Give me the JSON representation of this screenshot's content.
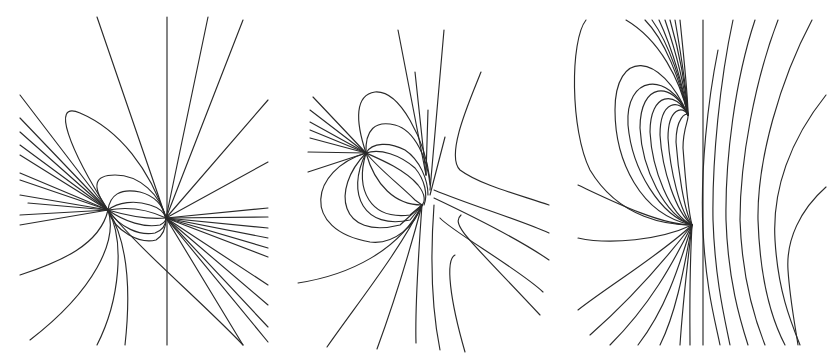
{
  "figure": {
    "background": "#ffffff",
    "stroke_color": "#2a2a2a",
    "panels": [
      {
        "id": "panel-1",
        "description": "Field lines of two like/unlike point sources, left pair with vertical symmetry line",
        "sources": [
          [
            108,
            210
          ],
          [
            166,
            218
          ]
        ],
        "paths": [
          "M167,17 L167,345",
          "M97,17 L166,218",
          "M208,17 L166,218",
          "M243,20 L166,218",
          "M268,100 L166,218",
          "M268,162 L166,218",
          "M268,208 L166,218",
          "M268,217 L166,218",
          "M268,228 L166,218",
          "M268,238 L166,218",
          "M268,248 L166,218",
          "M268,257 L166,218",
          "M268,285 L166,218",
          "M268,305 L166,218",
          "M268,327 L166,218",
          "M268,342 L166,218",
          "M243,345 L166,218",
          "M20,95 L108,210",
          "M20,118 L108,210",
          "M20,132 L108,210",
          "M20,145 L108,210",
          "M20,155 L108,210",
          "M20,173 L108,210",
          "M20,180 L108,210",
          "M20,195 L108,210",
          "M28,203 L108,210",
          "M20,215 L108,210",
          "M20,225 L108,210",
          "M108,210 C70,150 50,100 80,113 C120,130 150,170 166,218",
          "M108,210 C90,185 95,175 115,175 C140,175 160,195 166,218",
          "M108,210 C110,195 120,188 140,192 C155,196 163,205 166,218",
          "M108,210 C118,202 135,200 150,205 C160,208 164,212 166,218",
          "M108,210 C125,207 145,208 166,218",
          "M108,210 C125,215 145,220 166,218",
          "M108,210 C125,222 145,228 160,225 C164,223 166,220 166,218",
          "M108,210 C120,228 140,236 155,233 C163,230 166,224 166,218",
          "M108,210 C115,232 140,244 156,240 C164,235 166,226 166,218",
          "M108,210 C100,245 60,262 20,275",
          "M108,210 C118,240 95,290 30,340",
          "M108,210 C125,240 120,300 97,345",
          "M108,210 C130,245 130,300 125,345",
          "M108,210 C140,250 200,300 243,345"
        ]
      },
      {
        "id": "panel-2",
        "description": "Two sources with strong closed loops and a hyperbolic separatrix on the right",
        "sources": [
          [
            366,
            153
          ],
          [
            426,
            175
          ],
          [
            422,
            205
          ]
        ],
        "paths": [
          "M313,97 L366,153",
          "M310,110 L366,153",
          "M310,122 L366,153",
          "M310,130 L366,153",
          "M310,138 L366,153",
          "M308,152 L366,153",
          "M308,172 L366,153",
          "M398,30 L426,175",
          "M415,72 L426,175",
          "M428,110 L426,175",
          "M444,30 L430,190",
          "M445,137 L430,195",
          "M366,153 C355,120 355,95 375,92 C400,90 425,140 430,180",
          "M366,153 C365,130 375,120 395,125 C415,130 428,160 430,185",
          "M366,153 C372,142 390,142 405,150 C420,160 428,180 428,195",
          "M366,153 C380,148 400,155 415,168 C425,180 428,195 424,205",
          "M366,153 C382,160 405,170 418,185 C426,195 425,202 422,205",
          "M366,153 C380,170 400,185 415,200 L422,205",
          "M366,153 C375,185 395,205 422,205",
          "M366,153 C355,190 370,220 410,215 L422,205",
          "M366,153 C345,195 365,230 410,220 L422,205",
          "M366,153 C330,190 340,240 400,225 L422,205",
          "M366,153 C310,170 300,230 370,242 C395,245 415,225 422,205",
          "M422,205 C400,250 350,275 298,283",
          "M422,205 C400,250 360,300 327,347",
          "M422,205 C410,250 395,300 377,349",
          "M422,205 C418,260 415,310 416,343",
          "M434,205 C430,260 432,310 440,350",
          "M481,72 C470,100 445,155 460,170 C480,185 520,195 549,205",
          "M434,190 C470,205 520,220 549,233",
          "M434,198 C470,215 520,240 549,260",
          "M440,218 C450,230 520,270 543,292",
          "M461,215 C450,225 470,240 540,315",
          "M455,255 C445,260 450,300 465,352"
        ]
      },
      {
        "id": "panel-3",
        "description": "Single dipole-like source with concentric closed loops and parallel vertical field lines",
        "sources": [
          [
            688,
            115
          ],
          [
            692,
            225
          ]
        ],
        "paths": [
          "M703,20 L703,345",
          "M586,20 C570,40 570,130 590,170 C620,220 670,225 692,225",
          "M626,20 C660,40 680,80 688,115",
          "M645,20 C665,40 680,80 688,115",
          "M652,20 C670,45 682,85 688,115",
          "M659,20 C673,50 684,90 688,115",
          "M665,20 C677,55 685,90 688,115",
          "M670,20 C680,55 686,90 688,115",
          "M675,20 C682,60 687,95 688,115",
          "M680,20 C684,60 688,95 688,115",
          "M688,115 C660,50 615,50 615,110 C615,160 640,215 692,225",
          "M688,115 C668,70 625,75 628,125 C632,170 660,215 692,225",
          "M688,115 C672,80 640,82 640,128 C642,170 665,215 692,225",
          "M688,115 C676,90 650,92 650,132 C652,170 670,215 692,225",
          "M688,115 C680,98 660,100 660,135 C662,170 676,212 692,225",
          "M688,115 C683,105 668,108 668,138 C670,170 680,212 692,225",
          "M688,115 C686,112 676,118 676,142 C678,170 684,210 692,225",
          "M688,115 C689,120 683,128 683,148 C685,175 688,210 692,225",
          "M692,225 C660,225 610,200 578,185",
          "M692,225 C660,240 610,245 578,238",
          "M692,225 C660,255 610,285 578,310",
          "M692,225 C665,260 630,300 590,335",
          "M692,225 C672,265 650,305 610,345",
          "M692,225 C678,270 665,310 638,345",
          "M692,225 C683,275 675,315 660,345",
          "M692,225 C686,275 682,315 680,345",
          "M692,225 C689,280 690,320 690,345",
          "M718,50 C708,100 700,170 703,230 C706,290 715,320 720,345",
          "M733,20 C720,80 712,160 713,220 C715,280 725,320 730,345",
          "M755,20 C735,80 725,160 726,220 C728,280 740,320 748,345",
          "M778,20 C755,80 740,160 740,220 C742,280 755,320 765,345",
          "M812,20 C780,80 757,160 758,220 C760,280 772,320 785,345",
          "M826,95 C790,140 772,190 775,240 C778,290 790,320 800,345",
          "M826,187 C800,210 786,240 788,270 C790,300 795,325 798,345"
        ]
      }
    ]
  }
}
